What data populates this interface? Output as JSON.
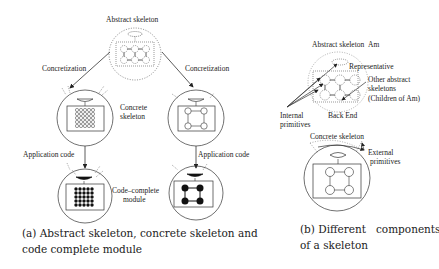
{
  "panel_a": {
    "abstract_label": "Abstract skeleton",
    "concretization_left": "Concretization",
    "concretization_right": "Concretization",
    "concrete_label_1": "Concrete",
    "concrete_label_2": "skeleton",
    "app_code_left": "Application code",
    "app_code_right": "Application code",
    "code_complete_1": "Code–complete",
    "code_complete_2": "module",
    "caption_1": "(a) Abstract skeleton, concrete skeleton and",
    "caption_2": "code complete module"
  },
  "panel_b": {
    "abstract_label": "Abstract skeleton",
    "am_label": "Am",
    "representative": "Representative",
    "other_1": "Other abstract",
    "other_2": "skeletons",
    "other_3": "(Children of Am)",
    "internal_1": "Internal",
    "internal_2": "primitives",
    "back_end": "Back End",
    "concrete_label": "Concrete skeleton",
    "external_1": "External",
    "external_2": "primitives",
    "caption_1": "(b) Different   components",
    "caption_2": "of a skeleton"
  }
}
